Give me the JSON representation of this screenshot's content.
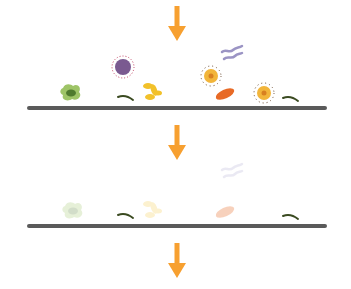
{
  "diagram": {
    "title": "",
    "colors": {
      "arrow": "#f7a030",
      "surface": "#5a5a5a",
      "amoeba": "#9ec467",
      "amoeba_nucleus": "#4f7a2e",
      "virus": "#7a5a90",
      "virus_spikes": "#c04060",
      "yeast": "#f2c12a",
      "spirillum": "#9b94c4",
      "coccus": "#f2b53a",
      "coccus_center": "#d88020",
      "bacillus": "#e86a26",
      "filament": "#3a4a20"
    },
    "arrows": [
      {
        "id": "arrow-top",
        "x": 176,
        "y": 6
      },
      {
        "id": "arrow-middle",
        "x": 176,
        "y": 125
      },
      {
        "id": "arrow-bottom",
        "x": 176,
        "y": 243
      }
    ],
    "surfaces": [
      {
        "id": "surface-before",
        "x": 27,
        "y": 106,
        "width": 300
      },
      {
        "id": "surface-after",
        "x": 27,
        "y": 224,
        "width": 300
      }
    ],
    "stage_before": {
      "microbes": [
        "amoeba",
        "virus",
        "filament",
        "yeast",
        "spirillum",
        "coccus",
        "bacillus",
        "coccus",
        "filament"
      ]
    },
    "stage_after": {
      "microbes": [
        "amoeba (faded)",
        "filament",
        "yeast (faded)",
        "spirillum (faded)",
        "bacillus (faded)",
        "filament"
      ]
    }
  }
}
